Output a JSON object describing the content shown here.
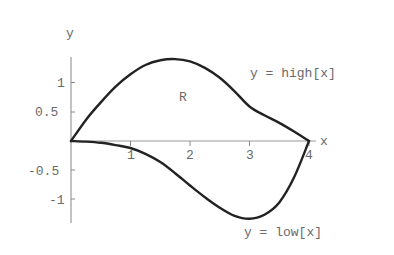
{
  "chart_data": {
    "type": "line",
    "title": "",
    "xlabel": "x",
    "ylabel": "y",
    "xlim": [
      0,
      4.1
    ],
    "ylim": [
      -1.4,
      1.45
    ],
    "grid": false,
    "x_ticks": [
      1,
      2,
      3,
      4
    ],
    "y_ticks": [
      -1,
      -0.5,
      0.5,
      1
    ],
    "x_tick_labels": [
      "1",
      "2",
      "3",
      "4"
    ],
    "y_tick_labels": [
      "-1",
      "-0.5",
      "0.5",
      "1"
    ],
    "series": [
      {
        "name": "y = high[x]",
        "x": [
          0,
          0.25,
          0.5,
          0.75,
          1,
          1.25,
          1.5,
          1.75,
          2,
          2.25,
          2.5,
          2.75,
          3,
          3.25,
          3.5,
          3.75,
          4
        ],
        "y": [
          0,
          0.36,
          0.66,
          0.93,
          1.14,
          1.3,
          1.38,
          1.4,
          1.36,
          1.25,
          1.08,
          0.85,
          0.59,
          0.44,
          0.31,
          0.16,
          0
        ]
      },
      {
        "name": "y = low[x]",
        "x": [
          0,
          0.25,
          0.5,
          0.75,
          1,
          1.25,
          1.5,
          1.75,
          2,
          2.25,
          2.5,
          2.75,
          3,
          3.25,
          3.5,
          3.75,
          4
        ],
        "y": [
          0,
          -0.01,
          -0.03,
          -0.07,
          -0.12,
          -0.22,
          -0.36,
          -0.55,
          -0.76,
          -0.96,
          -1.14,
          -1.28,
          -1.33,
          -1.26,
          -1.05,
          -0.62,
          0
        ]
      }
    ],
    "annotations": [
      {
        "text": "y = high[x]",
        "x": 3.0,
        "y": 1.15
      },
      {
        "text": "y = low[x]",
        "x": 2.9,
        "y": -1.62
      },
      {
        "text": "R",
        "x": 1.85,
        "y": 0.78
      }
    ]
  },
  "labels": {
    "x_axis": "x",
    "y_axis": "y",
    "high_curve": "y = high[x]",
    "low_curve": "y = low[x]",
    "region": "R",
    "xt1": "1",
    "xt2": "2",
    "xt3": "3",
    "xt4": "4",
    "yt1": "1",
    "yt05": "0.5",
    "ytm05": "-0.5",
    "ytm1": "-1"
  }
}
